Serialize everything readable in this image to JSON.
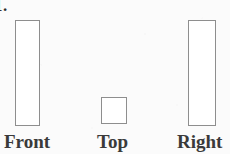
{
  "figure": {
    "problem_number": "1.",
    "background_color": "#fbfbfb",
    "stroke_color": "#8e8e8e",
    "fill_color": "#ffffff",
    "label_color": "#3a3a3a",
    "views": [
      {
        "name": "front",
        "label": "Front",
        "shape": "rectangle",
        "x": 15,
        "y": 20,
        "width": 25,
        "height": 106
      },
      {
        "name": "top",
        "label": "Top",
        "shape": "square",
        "x": 101,
        "y": 97,
        "width": 26,
        "height": 27
      },
      {
        "name": "right",
        "label": "Right",
        "shape": "rectangle",
        "x": 188,
        "y": 20,
        "width": 28,
        "height": 106
      }
    ]
  }
}
